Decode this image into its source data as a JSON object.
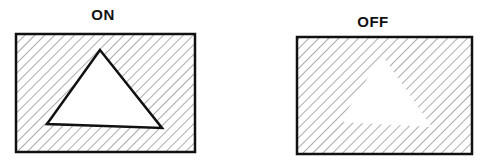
{
  "panels": [
    {
      "id": "on",
      "label": "ON",
      "label_pos": [
        103,
        6
      ],
      "rect": [
        16,
        34,
        179,
        118
      ],
      "triangle": [
        [
          100,
          50
        ],
        [
          47,
          124
        ],
        [
          162,
          128
        ]
      ],
      "triangle_outlined": true
    },
    {
      "id": "off",
      "label": "OFF",
      "label_pos": [
        373,
        13
      ],
      "rect": [
        297,
        37,
        175,
        117
      ],
      "triangle": [
        [
          382,
          55
        ],
        [
          340,
          122
        ],
        [
          432,
          127
        ]
      ],
      "triangle_outlined": false
    }
  ],
  "colors": {
    "border": "#111111",
    "hatch": "#555555",
    "fill": "#ffffff"
  }
}
